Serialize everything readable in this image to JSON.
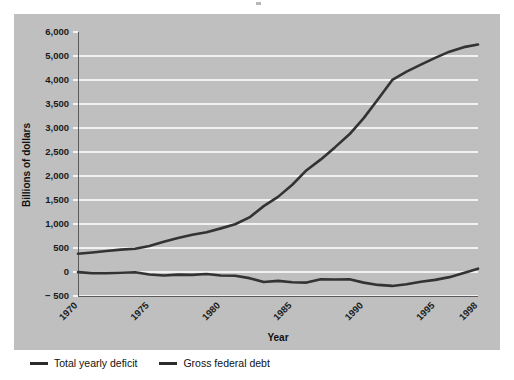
{
  "figure": {
    "background_color": "#ffffff",
    "panel_color": "#bfbfbf",
    "gridline_color": "#f2f2f2",
    "line_color": "#333333"
  },
  "chart_data": {
    "type": "line",
    "title": "",
    "subtitle": "",
    "xlabel": "Year",
    "ylabel": "Billions of dollars",
    "xlim": [
      1970,
      1998
    ],
    "ylim": [
      -500,
      6000
    ],
    "grid": true,
    "legend_position": "bottom-left",
    "ytick_labels": [
      "6,000",
      "5,000",
      "4,000",
      "3,500",
      "3,000",
      "2,500",
      "2,000",
      "1,500",
      "1,000",
      "500",
      "0",
      "− 500"
    ],
    "ytick_values": [
      6000,
      5000,
      4000,
      3500,
      3000,
      2500,
      2000,
      1500,
      1000,
      500,
      0,
      -500
    ],
    "xtick_labels": [
      "1970",
      "1975",
      "1980",
      "1985",
      "1990",
      "1995",
      "1998"
    ],
    "xtick_values": [
      1970,
      1975,
      1980,
      1985,
      1990,
      1995,
      1998
    ],
    "x": [
      1970,
      1971,
      1972,
      1973,
      1974,
      1975,
      1976,
      1977,
      1978,
      1979,
      1980,
      1981,
      1982,
      1983,
      1984,
      1985,
      1986,
      1987,
      1988,
      1989,
      1990,
      1991,
      1992,
      1993,
      1994,
      1995,
      1996,
      1997,
      1998
    ],
    "series": [
      {
        "name": "Total yearly deficit",
        "color": "#333333",
        "values": [
          -3,
          -23,
          -23,
          -15,
          -6,
          -53,
          -74,
          -54,
          -59,
          -41,
          -74,
          -79,
          -128,
          -208,
          -185,
          -212,
          -221,
          -150,
          -155,
          -152,
          -221,
          -269,
          -290,
          -255,
          -203,
          -164,
          -107,
          -22,
          69
        ]
      },
      {
        "name": "Gross federal debt",
        "color": "#333333",
        "values": [
          381,
          408,
          436,
          466,
          484,
          542,
          629,
          706,
          777,
          829,
          909,
          995,
          1137,
          1372,
          1565,
          1818,
          2121,
          2346,
          2601,
          2868,
          3206,
          3598,
          4002,
          4351,
          4643,
          4921,
          5181,
          5369,
          5478
        ]
      }
    ]
  },
  "legend": {
    "items": [
      {
        "label": "Total yearly deficit",
        "color": "#2b2b2b"
      },
      {
        "label": "Gross federal debt",
        "color": "#2b2b2b"
      }
    ]
  }
}
